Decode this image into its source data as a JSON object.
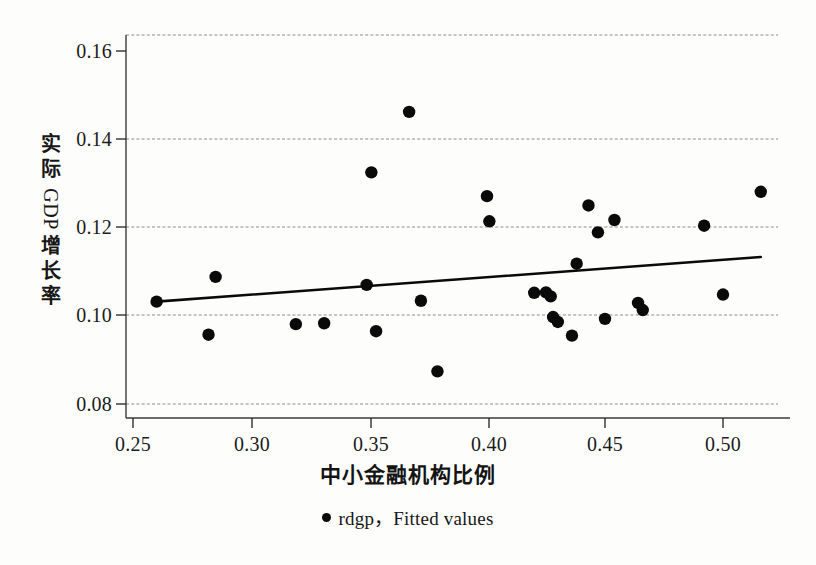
{
  "chart_data": {
    "type": "scatter",
    "title": "",
    "xlabel": "中小金融机构比例",
    "ylabel": "实际GDP增长率",
    "ylabel_parts": [
      "实",
      "际",
      "GDP",
      "增",
      "长",
      "率"
    ],
    "xlim": [
      0.2435,
      0.5175
    ],
    "ylim": [
      0.0785,
      0.1637
    ],
    "xticks": [
      0.25,
      0.3,
      0.35,
      0.4,
      0.45,
      0.5
    ],
    "xtick_labels": [
      "0.25",
      "0.30",
      "0.35",
      "0.40",
      "0.45",
      "0.50"
    ],
    "yticks": [
      0.08,
      0.1,
      0.12,
      0.14,
      0.16
    ],
    "ytick_labels": [
      "0.08",
      "0.10",
      "0.12",
      "0.14",
      "0.16"
    ],
    "grid": "horizontal-dashed",
    "legend_position": "below-axis-center",
    "legend": [
      {
        "marker": "filled-circle",
        "label": "rdgp，Fitted values"
      }
    ],
    "series": [
      {
        "name": "rdgp",
        "type": "scatter",
        "marker": "filled-circle",
        "color": "#0a0a0a",
        "points": [
          {
            "x": 0.26,
            "y": 0.1032
          },
          {
            "x": 0.282,
            "y": 0.0957
          },
          {
            "x": 0.285,
            "y": 0.1088
          },
          {
            "x": 0.319,
            "y": 0.0981
          },
          {
            "x": 0.331,
            "y": 0.0983
          },
          {
            "x": 0.349,
            "y": 0.107
          },
          {
            "x": 0.351,
            "y": 0.1325
          },
          {
            "x": 0.353,
            "y": 0.0965
          },
          {
            "x": 0.367,
            "y": 0.1462
          },
          {
            "x": 0.372,
            "y": 0.1034
          },
          {
            "x": 0.379,
            "y": 0.0874
          },
          {
            "x": 0.4,
            "y": 0.1271
          },
          {
            "x": 0.401,
            "y": 0.1214
          },
          {
            "x": 0.42,
            "y": 0.1052
          },
          {
            "x": 0.425,
            "y": 0.1053
          },
          {
            "x": 0.427,
            "y": 0.1044
          },
          {
            "x": 0.428,
            "y": 0.0997
          },
          {
            "x": 0.43,
            "y": 0.0986
          },
          {
            "x": 0.436,
            "y": 0.0955
          },
          {
            "x": 0.438,
            "y": 0.1118
          },
          {
            "x": 0.443,
            "y": 0.125
          },
          {
            "x": 0.447,
            "y": 0.1189
          },
          {
            "x": 0.45,
            "y": 0.0993
          },
          {
            "x": 0.454,
            "y": 0.1217
          },
          {
            "x": 0.464,
            "y": 0.1029
          },
          {
            "x": 0.466,
            "y": 0.1013
          },
          {
            "x": 0.492,
            "y": 0.1204
          },
          {
            "x": 0.5,
            "y": 0.1048
          },
          {
            "x": 0.516,
            "y": 0.1281
          }
        ]
      },
      {
        "name": "Fitted values",
        "type": "line",
        "color": "#0a0a0a",
        "points": [
          {
            "x": 0.26,
            "y": 0.1032
          },
          {
            "x": 0.516,
            "y": 0.1133
          }
        ]
      }
    ]
  }
}
